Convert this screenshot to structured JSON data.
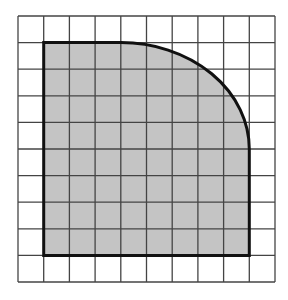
{
  "diagram": {
    "type": "grid-area-figure",
    "grid": {
      "columns": 10,
      "rows": 10,
      "line_color": "#444444",
      "background": "#ffffff"
    },
    "shape": {
      "description": "Shaded region bounded by straight edges on left, bottom, top and right with a curved (quarter-circle-like) upper-right corner",
      "fill_color": "#c4c4c4",
      "outline_color": "#111111",
      "bounds_cells": {
        "left": 1,
        "top": 1,
        "right": 9,
        "bottom": 9
      },
      "arc_cells": {
        "start": [
          4,
          1
        ],
        "end": [
          9,
          5
        ]
      }
    }
  }
}
